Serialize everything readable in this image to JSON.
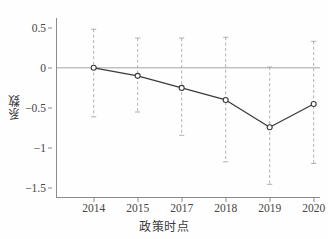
{
  "chart_data": {
    "type": "line",
    "title": "",
    "subtitle": "",
    "xlabel": "政策时点",
    "ylabel": "系数",
    "categories": [
      "2014",
      "2015",
      "2017",
      "2018",
      "2019",
      "2020"
    ],
    "values": [
      0.0,
      -0.1,
      -0.25,
      -0.4,
      -0.74,
      -0.45
    ],
    "series": [
      {
        "name": "系数",
        "values": [
          0.0,
          -0.1,
          -0.25,
          -0.4,
          -0.74,
          -0.45
        ],
        "ci_lower": [
          -0.61,
          -0.55,
          -0.84,
          -1.17,
          -1.45,
          -1.19
        ],
        "ci_upper": [
          0.48,
          0.37,
          0.37,
          0.38,
          0.01,
          0.33
        ]
      }
    ],
    "error_bars": {
      "style": "dashed",
      "caps": true,
      "lower": [
        -0.61,
        -0.55,
        -0.84,
        -1.17,
        -1.45,
        -1.19
      ],
      "upper": [
        0.48,
        0.37,
        0.37,
        0.38,
        0.01,
        0.33
      ]
    },
    "yticks": [
      0.5,
      0,
      -0.5,
      -1,
      -1.5
    ],
    "ytick_labels": [
      "0.5",
      "0",
      "−0.5",
      "−1",
      "−1.5"
    ],
    "xtick_labels": [
      "2014",
      "2015",
      "2017",
      "2018",
      "2019",
      "2020"
    ],
    "ylim": [
      -1.62,
      0.62
    ],
    "grid": false,
    "zero_line": 0,
    "legend": "none",
    "marker": "circle-open",
    "colors": {
      "line": "#3a3a3a",
      "marker_edge": "#3a3a3a",
      "marker_fill": "#ffffff",
      "error_bar": "#a8a8a8",
      "zero_line": "#9a9a9a",
      "axis": "#8c8c8c",
      "text": "#454545"
    }
  }
}
